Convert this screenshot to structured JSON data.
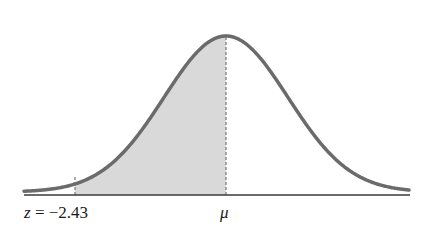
{
  "diagram": {
    "type": "normal-distribution-curve",
    "shaded_region": "between z and mean",
    "labels": {
      "z_var": "z",
      "z_eq": " = −2.43",
      "mean": "μ"
    },
    "z_value": -2.43,
    "colors": {
      "curve": "#6b6b6b",
      "fill": "#d9d9d9",
      "axis": "#3a3a3a",
      "dashed": "#777777"
    }
  }
}
